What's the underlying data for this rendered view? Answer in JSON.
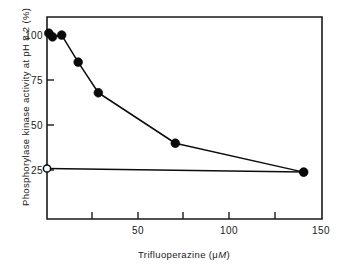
{
  "figure": {
    "background_color": "#ffffff",
    "ink_color": "#0a0a0a"
  },
  "chart_data": {
    "type": "line",
    "title": "",
    "subtitle": "",
    "xlabel": "Trifluoperazine (μM)",
    "xlabel_parts": {
      "text": "Trifluoperazine (",
      "unit_mu": "μ",
      "unit_m_italic": "M",
      "close": ")"
    },
    "ylabel": "Phosphorylase kinase activity at pH 8.2 (%)",
    "xlim": [
      0,
      150
    ],
    "ylim": [
      0,
      112
    ],
    "xticks": [
      0,
      25,
      50,
      75,
      100,
      125,
      150
    ],
    "xtick_labels": [
      "",
      "",
      "50",
      "",
      "100",
      "",
      "150"
    ],
    "yticks": [
      25,
      50,
      75,
      100
    ],
    "ytick_labels": [
      "25",
      "50",
      "75",
      "100"
    ],
    "grid": false,
    "legend": null,
    "series": [
      {
        "name": "Phosphorylase kinase activity vs trifluoperazine",
        "marker": "filled-circle",
        "x": [
          1,
          3,
          8,
          17,
          28,
          70,
          140
        ],
        "y": [
          103,
          101,
          102,
          87,
          70,
          42,
          26
        ]
      },
      {
        "name": "Control (no trifluoperazine) reference",
        "marker": "open-circle",
        "x": [
          0,
          140
        ],
        "y": [
          28,
          26
        ]
      }
    ],
    "annotations": []
  }
}
